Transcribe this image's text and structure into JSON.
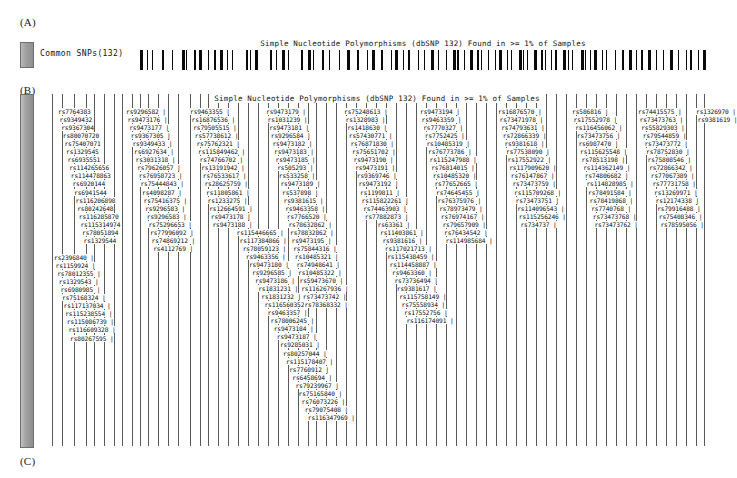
{
  "figure": {
    "panels": [
      {
        "id": "A",
        "label": "(A)"
      },
      {
        "id": "B",
        "label": "(B)"
      },
      {
        "id": "C",
        "label": "(C)"
      }
    ]
  },
  "panel_a": {
    "track_name": "Common SNPs(132)",
    "track_title": "Simple Nucleotide Polymorphisms (dbSNP 132) Found in >= 1% of Samples",
    "swatch_color": "#9e9e9e",
    "tick_color": "#0a0a0a",
    "ticks": [
      0,
      1.2,
      2.1,
      3.9,
      5.6,
      7.4,
      8.2,
      9.6,
      10.4,
      12.1,
      13.0,
      14.2,
      15.4,
      16.2,
      18.7,
      19.5,
      20.3,
      22.9,
      24.1,
      25.0,
      26.2,
      28.4,
      29.7,
      30.6,
      32.1,
      33.4,
      35.2,
      36.5,
      38.4,
      40.1,
      41.0,
      42.6,
      44.3,
      45.1,
      46.5,
      47.4,
      49.2,
      50.1,
      51.4,
      52.6,
      54.1,
      55.3,
      56.0,
      57.2,
      58.3,
      59.5,
      60.2,
      61.4,
      62.7,
      63.5,
      64.8,
      65.6,
      66.9,
      67.7,
      68.4,
      69.6,
      70.8,
      71.5,
      72.6,
      73.4,
      74.8,
      75.6,
      76.4,
      77.9,
      78.6,
      79.5,
      80.3,
      81.6,
      82.4,
      83.9,
      85.2,
      86.4,
      87.6,
      88.5,
      89.7,
      91.2,
      92.4,
      93.6,
      95.1,
      96.4,
      97.2,
      98.6,
      99.4
    ]
  },
  "panel_b": {
    "track_title": "Simple Nucleotide Polymorphisms (dbSNP 132) Found in >= 1% of Samples",
    "swatch_color": "#a3a3a3",
    "line_color": "#5a5a5a",
    "columns": [
      {
        "x": 10,
        "y": 14,
        "items": [
          "rs7764383",
          "rs9349432",
          "rs9367304",
          "rs80070720",
          "rs75407071",
          "rs1329545",
          "rs6935551",
          "rs114265656",
          "rs114478863",
          "rs6920144",
          "rs6941544",
          "rs116206898",
          "rs80242648",
          "rs116285870",
          "rs115314974",
          "rs78051894",
          "rs1329544"
        ]
      },
      {
        "x": 78,
        "y": 14,
        "items": [
          "rs9296582 |",
          "rs9473176 |",
          "rs9473177 |",
          "rs9367305 |",
          "rs9349433 |",
          "rs6927634 |",
          "rs3031318 |",
          "rs79626057 |",
          "rs76958723 |",
          "rs75444843 |",
          "rs4098287 |",
          "rs75416375 |",
          "rs9296583 |",
          "rs9296583 |",
          "rs75296653 |",
          "rs77996092 |",
          "rs74869212 |",
          "rs4112769 |"
        ]
      },
      {
        "x": 6,
        "y": 160,
        "items": [
          "rs2396840 |",
          "rs1159924 |",
          "rs78012355 |",
          "rs1329543 |",
          "rs6980985 |",
          "rs75168324 |",
          "rs117137034 |",
          "rs115238554 |",
          "rs115086739 |",
          "rs116609328 |",
          "rs80267595 |"
        ]
      },
      {
        "x": 142,
        "y": 14,
        "items": [
          "rs9463355 |",
          "rs16876536 |",
          "rs79505515 |",
          "rs57738612 |",
          "rs75762321 |",
          "rs115849462 |",
          "rs74766702 |",
          "rs13191942 |",
          "rs76533617 |",
          "rs28625759 |",
          "rs11805861 |",
          "rs1233275 |",
          "rs12664591 |",
          "rs9473178 |",
          "rs9473188 |",
          "rs115446665 |",
          "rs117384866 |",
          "rs78059123 |",
          "rs9463356 |",
          "rs9473180 |",
          "rs9296585 |",
          "rs9473186 |",
          "rs1831231 |",
          "rs1831232 |",
          "rs116560352 |",
          "rs9463357 |",
          "rs78006245 |",
          "rs9473184 |",
          "rs9473187 |",
          "rs9285031 |",
          "rs80257044 |",
          "rs115178407 |",
          "rs7760912 |",
          "rs6458694 |",
          "rs79239967 |",
          "rs75165840 |",
          "rs76073226 |",
          "rs79075408 |",
          "rs116347969 |"
        ]
      },
      {
        "x": 218,
        "y": 14,
        "items": [
          "rs9473179 |",
          "rs1031239 |",
          "rs9473181 |",
          "rs9296584 |",
          "rs9473182 |",
          "rs9473183 |",
          "rs9473185 |",
          "rs505293 |",
          "rs533258 |",
          "rs9473189 |",
          "rs537898 |",
          "rs9381615 |",
          "rs9463358 |",
          "rs7766520 |",
          "rs78632862 |",
          "rs78832862 |",
          "rs9473195 |",
          "rs75844316 |",
          "rs10485321 |",
          "rs74948641 |",
          "rs10485322 |",
          "rs59473670 |",
          "rs116267936 |",
          "rs73473742 |",
          "rs78368332 |"
        ]
      },
      {
        "x": 296,
        "y": 14,
        "items": [
          "rs75248613 |",
          "rs1328983 |",
          "rs1418630 |",
          "rs57430771 |",
          "rs76871830 |",
          "rs75651702 |",
          "rs9473190 |",
          "rs9473191 |",
          "rs9369746 |",
          "rs9473192 |",
          "rs1199811 |",
          "rs115822261 |",
          "rs74463903 |",
          "rs77882873 |",
          "rs63361 |",
          "rs11403861 |",
          "rs9381616 |",
          "rs117021713 |",
          "rs115438459 |",
          "rs114458887 |",
          "rs9463360 |",
          "rs73736494 |",
          "rs9381617 |",
          "rs115758149 |",
          "rs75558934 |",
          "rs17552756 |",
          "rs116174091 |"
        ]
      },
      {
        "x": 372,
        "y": 14,
        "items": [
          "rs9473194 |",
          "rs9463359 |",
          "rs7770327 |",
          "rs7752425 |",
          "rs10485319 |",
          "rs76773786 |",
          "rs115247988 |",
          "rs76814015 |",
          "rs10485320 |",
          "rs77652665 |",
          "rs74645455 |",
          "rs76375976 |",
          "rs78973479 |",
          "rs76974167 |",
          "rs79657909 |",
          "rs76434542 |",
          "rs114985684 |"
        ]
      },
      {
        "x": 450,
        "y": 14,
        "items": [
          "rs16876570 |",
          "rs73471978 |",
          "rs74793631 |",
          "rs72866339 |",
          "rs9381618 |",
          "rs77538090 |",
          "rs17552922 |",
          "rs117909620 |",
          "rs76147867 |",
          "rs73473759 |",
          "rs115709268 |",
          "rs73473751 |",
          "rs114096543 |",
          "rs115256246 |",
          "rs734737 |"
        ]
      },
      {
        "x": 524,
        "y": 14,
        "items": [
          "rs586816 |",
          "rs17552978 |",
          "rs116456062 |",
          "rs73473756 |",
          "rs6987470 |",
          "rs115625548 |",
          "rs78513198 |",
          "rs114362149 |",
          "rs74806682 |",
          "rs114828985 |",
          "rs78491584 |",
          "rs78419868 |",
          "rs7740768 |",
          "rs73473768 |",
          "rs73473762 |"
        ]
      },
      {
        "x": 590,
        "y": 14,
        "items": [
          "rs74415575 |",
          "rs73473763 |",
          "rs55829303 |",
          "rs79544859 |",
          "rs73473772 |",
          "rs78752830 |",
          "rs75808546 |",
          "rs72866342 |",
          "rs77067389 |",
          "rs77731758 |",
          "rs13269971 |",
          "rs12174338 |",
          "rs79916488 |",
          "rs75408346 |",
          "rs78595056 |"
        ]
      },
      {
        "x": 648,
        "y": 14,
        "items": [
          "rs1326970 |",
          "rs9381619 |"
        ]
      }
    ],
    "vlines": [
      4,
      14,
      26,
      38,
      46,
      56,
      66,
      74,
      84,
      92,
      100,
      110,
      120,
      130,
      142,
      152,
      160,
      170,
      180,
      190,
      200,
      210,
      220,
      230,
      240,
      250,
      260,
      268,
      278,
      288,
      298,
      308,
      318,
      328,
      338,
      348,
      358,
      368,
      378,
      388,
      398,
      408,
      418,
      428,
      438,
      448,
      458,
      468,
      478,
      488,
      498,
      508,
      518,
      528,
      538,
      548,
      558,
      568,
      578,
      588,
      598,
      608,
      618,
      628,
      638,
      648,
      656
    ]
  },
  "panel_c": {
    "swatch_color": "#8d8d8d"
  }
}
